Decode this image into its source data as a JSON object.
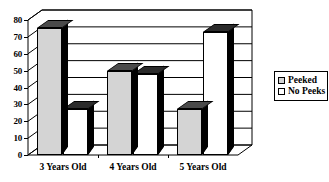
{
  "chart_data": {
    "type": "bar",
    "title": "",
    "xlabel": "",
    "ylabel": "",
    "categories": [
      "3 Years Old",
      "4 Years Old",
      "5 Years Old"
    ],
    "series": [
      {
        "name": "Peeked",
        "values": [
          75,
          50,
          27
        ],
        "color": "#d4d4d4"
      },
      {
        "name": "No Peeks",
        "values": [
          27,
          48,
          73
        ],
        "color": "#ffffff"
      }
    ],
    "ylim": [
      0,
      80
    ],
    "yticks": [
      0,
      10,
      20,
      30,
      40,
      50,
      60,
      70,
      80
    ],
    "ytick_labels": [
      "0",
      "10",
      "20",
      "30",
      "40",
      "50",
      "60",
      "70",
      "80"
    ],
    "grid": true,
    "legend_position": "right",
    "style": "3d-column"
  },
  "legend": {
    "entries": [
      {
        "label": "Peeked"
      },
      {
        "label": "No Peeks"
      }
    ]
  }
}
